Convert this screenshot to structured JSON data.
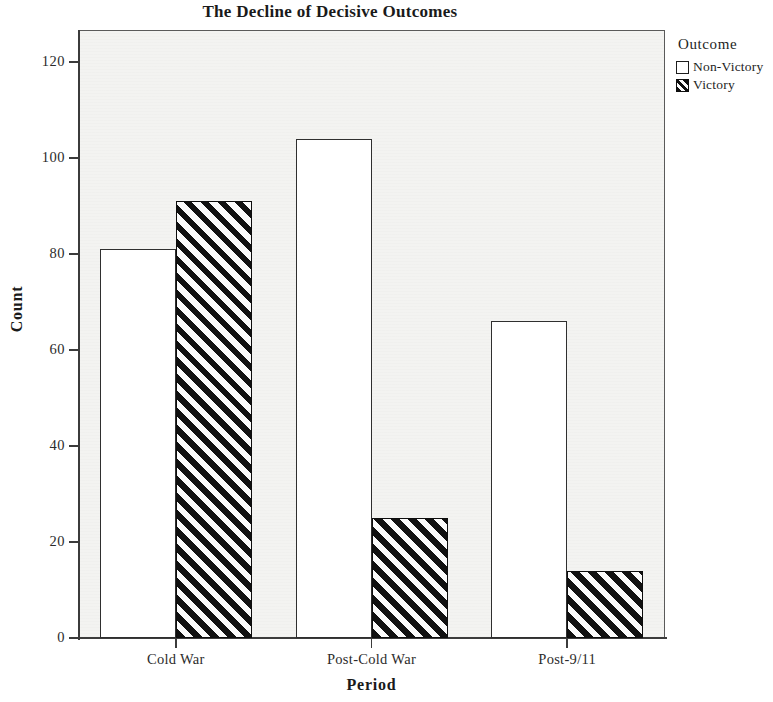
{
  "chart_data": {
    "type": "bar",
    "title": "The Decline of Decisive Outcomes",
    "xlabel": "Period",
    "ylabel": "Count",
    "categories": [
      "Cold War",
      "Post-Cold War",
      "Post-9/11"
    ],
    "series": [
      {
        "name": "Non-Victory",
        "values": [
          81,
          104,
          66
        ],
        "fill": "white",
        "border": "#2f2f2f"
      },
      {
        "name": "Victory",
        "values": [
          91,
          25,
          14
        ],
        "fill": "black-diagonal-hatch",
        "border": "#0d0d0d"
      }
    ],
    "ylim": [
      0,
      126
    ],
    "yticks": [
      0,
      20,
      40,
      60,
      80,
      100,
      120
    ],
    "ytick_labels": [
      "0",
      "20",
      "40",
      "60",
      "80",
      "100",
      "120"
    ],
    "grid": false,
    "legend": {
      "title": "Outcome",
      "position": "right-top",
      "entries": [
        {
          "label": "Non-Victory",
          "swatch": "white-square"
        },
        {
          "label": "Victory",
          "swatch": "hatched-square"
        }
      ]
    },
    "panel_background": "#f3f3f1",
    "axis_color": "#3b3b3b"
  }
}
